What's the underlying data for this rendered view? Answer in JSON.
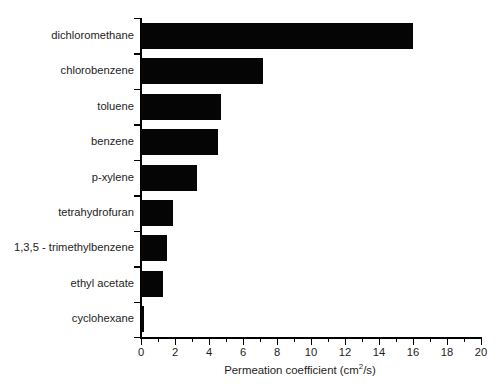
{
  "chart_data": {
    "type": "bar",
    "orientation": "horizontal",
    "title": "",
    "subtitle": "",
    "xlabel_prefix": "Permeation coefficient (cm",
    "xlabel_sup": "2",
    "xlabel_suffix": "/s)",
    "xlabel": "Permeation coefficient (cm2/s)",
    "ylabel": "",
    "xlim": [
      0,
      20
    ],
    "ylim": null,
    "grid": false,
    "legend": null,
    "x_major_ticks": [
      0,
      2,
      4,
      6,
      8,
      10,
      12,
      14,
      16,
      18,
      20
    ],
    "x_minor_ticks": [
      1,
      3,
      5,
      7,
      9,
      11,
      13,
      15,
      17,
      19
    ],
    "x_tick_labels": [
      "0",
      "2",
      "4",
      "6",
      "8",
      "10",
      "12",
      "14",
      "16",
      "18",
      "20"
    ],
    "categories": [
      "dichloromethane",
      "chlorobenzene",
      "toluene",
      "benzene",
      "p-xylene",
      "tetrahydrofuran",
      "1,3,5 - trimethylbenzene",
      "ethyl acetate",
      "cyclohexane"
    ],
    "values": [
      16.0,
      7.2,
      4.7,
      4.5,
      3.3,
      1.9,
      1.5,
      1.3,
      0.2
    ],
    "bar_color": "#050505",
    "axis_color": "#000000",
    "background_color": "#ffffff"
  }
}
